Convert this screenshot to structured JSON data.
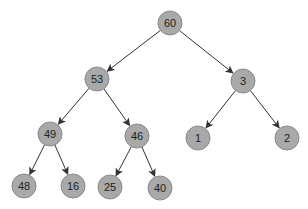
{
  "diagram": {
    "type": "binary-tree",
    "colors": {
      "node_fill": "#a9a9a9",
      "node_stroke": "#8a8a8a",
      "edge": "#333333",
      "label": "#222222"
    },
    "node_radius": 12,
    "nodes": [
      {
        "id": "n60",
        "label": "60",
        "x": 170,
        "y": 23
      },
      {
        "id": "n53",
        "label": "53",
        "x": 97,
        "y": 79
      },
      {
        "id": "n3",
        "label": "3",
        "x": 243,
        "y": 81
      },
      {
        "id": "n49",
        "label": "49",
        "x": 50,
        "y": 134
      },
      {
        "id": "n46",
        "label": "46",
        "x": 137,
        "y": 136
      },
      {
        "id": "n1",
        "label": "1",
        "x": 198,
        "y": 138
      },
      {
        "id": "n2",
        "label": "2",
        "x": 287,
        "y": 138
      },
      {
        "id": "n48",
        "label": "48",
        "x": 24,
        "y": 186
      },
      {
        "id": "n16",
        "label": "16",
        "x": 73,
        "y": 186
      },
      {
        "id": "n25",
        "label": "25",
        "x": 110,
        "y": 187
      },
      {
        "id": "n40",
        "label": "40",
        "x": 160,
        "y": 188
      }
    ],
    "edges": [
      {
        "from": "n60",
        "to": "n53"
      },
      {
        "from": "n60",
        "to": "n3"
      },
      {
        "from": "n53",
        "to": "n49"
      },
      {
        "from": "n53",
        "to": "n46"
      },
      {
        "from": "n3",
        "to": "n1"
      },
      {
        "from": "n3",
        "to": "n2"
      },
      {
        "from": "n49",
        "to": "n48"
      },
      {
        "from": "n49",
        "to": "n16"
      },
      {
        "from": "n46",
        "to": "n25"
      },
      {
        "from": "n46",
        "to": "n40"
      }
    ]
  }
}
